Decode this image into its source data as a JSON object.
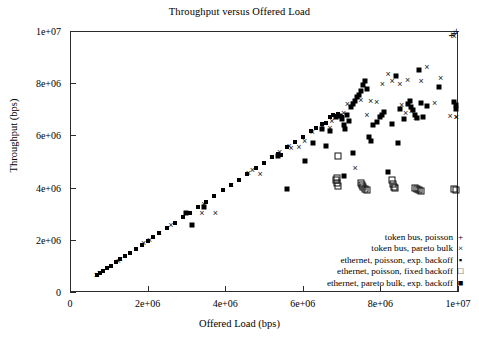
{
  "chart_data": {
    "type": "scatter",
    "title": "Throughput versus Offered Load",
    "xlabel": "Offered Load (bps)",
    "ylabel": "Throughput (bps)",
    "xlim": [
      0,
      10000000
    ],
    "ylim": [
      0,
      10000000
    ],
    "grid": false,
    "legend_position": "inside-bottom-right",
    "xticks": [
      {
        "value": 0,
        "label": "0"
      },
      {
        "value": 2000000,
        "label": "2e+06"
      },
      {
        "value": 4000000,
        "label": "4e+06"
      },
      {
        "value": 6000000,
        "label": "6e+06"
      },
      {
        "value": 8000000,
        "label": "8e+06"
      },
      {
        "value": 10000000,
        "label": "1e+07"
      }
    ],
    "yticks": [
      {
        "value": 0,
        "label": "0"
      },
      {
        "value": 2000000,
        "label": "2e+06"
      },
      {
        "value": 4000000,
        "label": "4e+06"
      },
      {
        "value": 6000000,
        "label": "6e+06"
      },
      {
        "value": 8000000,
        "label": "8e+06"
      },
      {
        "value": 10000000,
        "label": "1e+07"
      }
    ],
    "series": [
      {
        "name": "token bus, poisson",
        "marker": "plus",
        "points": [
          [
            9900000,
            9880000
          ],
          [
            9960000,
            9960000
          ],
          [
            9830000,
            9800000
          ]
        ]
      },
      {
        "name": "token bus, pareto bulk",
        "marker": "cross",
        "points": [
          [
            680000,
            640000
          ],
          [
            700000,
            660000
          ],
          [
            760000,
            720000
          ],
          [
            1250000,
            1200000
          ],
          [
            1300000,
            1260000
          ],
          [
            1900000,
            1860000
          ],
          [
            2050000,
            2010000
          ],
          [
            2300000,
            2270000
          ],
          [
            2600000,
            2560000
          ],
          [
            3050000,
            3010000
          ],
          [
            3400000,
            3010000
          ],
          [
            3750000,
            3030000
          ],
          [
            3450000,
            3380000
          ],
          [
            4150000,
            4110000
          ],
          [
            4600000,
            4560000
          ],
          [
            4900000,
            4520000
          ],
          [
            4700000,
            4660000
          ],
          [
            5200000,
            5170000
          ],
          [
            5400000,
            5350000
          ],
          [
            5650000,
            5600000
          ],
          [
            5700000,
            5500000
          ],
          [
            5900000,
            5550000
          ],
          [
            6050000,
            5780000
          ],
          [
            6250000,
            6130000
          ],
          [
            6500000,
            6310000
          ],
          [
            6700000,
            6280000
          ],
          [
            6750000,
            6540000
          ],
          [
            6850000,
            6720000
          ],
          [
            6900000,
            6800000
          ],
          [
            7050000,
            6870000
          ],
          [
            7150000,
            7200000
          ],
          [
            7300000,
            7260000
          ],
          [
            7350000,
            4770000
          ],
          [
            7500000,
            7350000
          ],
          [
            7650000,
            6800000
          ],
          [
            7750000,
            7300000
          ],
          [
            7900000,
            7290000
          ],
          [
            8050000,
            7980000
          ],
          [
            8200000,
            8360000
          ],
          [
            8300000,
            8090000
          ],
          [
            8500000,
            7960000
          ],
          [
            8550000,
            7170000
          ],
          [
            8650000,
            6860000
          ],
          [
            8700000,
            8120000
          ],
          [
            8800000,
            6930000
          ],
          [
            8900000,
            6680000
          ],
          [
            8950000,
            6670000
          ],
          [
            9050000,
            8090000
          ],
          [
            9200000,
            8630000
          ],
          [
            9400000,
            7250000
          ],
          [
            9550000,
            8210000
          ],
          [
            9800000,
            6750000
          ],
          [
            9900000,
            9790000
          ],
          [
            9950000,
            6720000
          ],
          [
            9960000,
            6700000
          ]
        ]
      },
      {
        "name": "ethernet, poisson, exp. backoff",
        "marker": "small-square",
        "points": [
          [
            700000,
            660000
          ],
          [
            780000,
            740000
          ],
          [
            850000,
            810000
          ],
          [
            960000,
            920000
          ],
          [
            1050000,
            1010000
          ],
          [
            1180000,
            1140000
          ],
          [
            1300000,
            1260000
          ],
          [
            1420000,
            1380000
          ],
          [
            1550000,
            1510000
          ],
          [
            1700000,
            1660000
          ],
          [
            1850000,
            1810000
          ],
          [
            2000000,
            1960000
          ],
          [
            2150000,
            2110000
          ],
          [
            2300000,
            2260000
          ],
          [
            2500000,
            2460000
          ],
          [
            2700000,
            2660000
          ],
          [
            2900000,
            2860000
          ],
          [
            3080000,
            3040000
          ],
          [
            3300000,
            3260000
          ],
          [
            3500000,
            3460000
          ],
          [
            3700000,
            3660000
          ],
          [
            3950000,
            3910000
          ],
          [
            4150000,
            4110000
          ],
          [
            4350000,
            4310000
          ],
          [
            4550000,
            4510000
          ],
          [
            4800000,
            4760000
          ],
          [
            5000000,
            4960000
          ],
          [
            5200000,
            5160000
          ],
          [
            5350000,
            5280000
          ],
          [
            5450000,
            5250000
          ],
          [
            5600000,
            5560000
          ],
          [
            5800000,
            5750000
          ],
          [
            6000000,
            5950000
          ],
          [
            6200000,
            6150000
          ],
          [
            6350000,
            6300000
          ],
          [
            6500000,
            6450000
          ],
          [
            6600000,
            6480000
          ],
          [
            6700000,
            6700000
          ],
          [
            6780000,
            6800000
          ],
          [
            6850000,
            6750000
          ],
          [
            6900000,
            6820000
          ],
          [
            7000000,
            6700000
          ]
        ]
      },
      {
        "name": "ethernet, poisson, fixed backoff",
        "marker": "open-square",
        "points": [
          [
            6900000,
            5200000
          ],
          [
            6850000,
            4300000
          ],
          [
            6880000,
            4180000
          ],
          [
            6900000,
            4060000
          ],
          [
            7500000,
            4180000
          ],
          [
            7520000,
            4100000
          ],
          [
            7560000,
            4020000
          ],
          [
            7600000,
            3960000
          ],
          [
            7650000,
            3900000
          ],
          [
            8300000,
            4280000
          ],
          [
            8320000,
            4120000
          ],
          [
            8350000,
            4040000
          ],
          [
            8380000,
            3980000
          ],
          [
            8900000,
            4000000
          ],
          [
            8950000,
            3960000
          ],
          [
            9000000,
            3900000
          ],
          [
            9050000,
            3870000
          ],
          [
            9900000,
            3960000
          ],
          [
            9950000,
            3920000
          ],
          [
            6880000,
            4350000
          ]
        ]
      },
      {
        "name": "ethernet, pareto bulk, exp. backoff",
        "marker": "square",
        "points": [
          [
            5600000,
            3950000
          ],
          [
            6050000,
            5010000
          ],
          [
            6250000,
            5700000
          ],
          [
            6500000,
            6250000
          ],
          [
            6700000,
            6180000
          ],
          [
            6850000,
            6700000
          ],
          [
            6950000,
            6760000
          ],
          [
            7000000,
            6640000
          ],
          [
            7050000,
            6400000
          ],
          [
            7100000,
            6260000
          ],
          [
            7150000,
            6770000
          ],
          [
            7200000,
            6540000
          ],
          [
            7250000,
            7080000
          ],
          [
            7300000,
            7200000
          ],
          [
            7350000,
            7320000
          ],
          [
            7400000,
            7480000
          ],
          [
            7450000,
            7560000
          ],
          [
            7500000,
            7700000
          ],
          [
            7550000,
            7940000
          ],
          [
            7600000,
            8070000
          ],
          [
            7650000,
            7790000
          ],
          [
            7700000,
            5950000
          ],
          [
            7750000,
            5790000
          ],
          [
            7800000,
            6400000
          ],
          [
            7900000,
            6530000
          ],
          [
            8000000,
            6700000
          ],
          [
            8050000,
            6800000
          ],
          [
            8100000,
            6900000
          ],
          [
            8200000,
            4600000
          ],
          [
            8300000,
            6430000
          ],
          [
            8400000,
            8280000
          ],
          [
            8450000,
            5720000
          ],
          [
            8500000,
            7030000
          ],
          [
            8600000,
            6640000
          ],
          [
            8700000,
            7190000
          ],
          [
            8750000,
            7330000
          ],
          [
            8800000,
            7090000
          ],
          [
            8850000,
            6960000
          ],
          [
            8900000,
            6770000
          ],
          [
            8950000,
            6680000
          ],
          [
            9000000,
            8500000
          ],
          [
            9050000,
            7240000
          ],
          [
            9100000,
            6700000
          ],
          [
            9200000,
            7140000
          ],
          [
            9500000,
            7850000
          ],
          [
            9900000,
            7280000
          ],
          [
            9950000,
            7180000
          ],
          [
            9960000,
            7000000
          ],
          [
            7300000,
            5330000
          ],
          [
            7050000,
            4460000
          ],
          [
            6600000,
            5600000
          ],
          [
            3450000,
            3270000
          ],
          [
            3150000,
            2560000
          ],
          [
            2980000,
            3040000
          ],
          [
            5350000,
            5200000
          ]
        ]
      }
    ]
  },
  "legend": {
    "items": [
      {
        "label": "token bus, poisson",
        "mark": "+"
      },
      {
        "label": "token bus, pareto bulk",
        "mark": "×"
      },
      {
        "label": "ethernet, poisson, exp. backoff",
        "mark": "▪"
      },
      {
        "label": "ethernet, poisson, fixed backoff",
        "mark": "□"
      },
      {
        "label": "ethernet, pareto bulk, exp. backoff",
        "mark": "■"
      }
    ]
  }
}
